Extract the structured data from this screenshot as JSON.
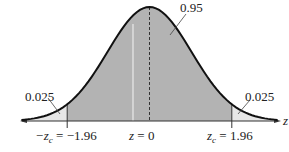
{
  "chart_data": {
    "type": "area",
    "title": "",
    "xlabel": "z",
    "ylabel": "",
    "mean": 0,
    "std": 1,
    "xlim": [
      -3.2,
      3.2
    ],
    "critical_values": [
      -1.96,
      1.96
    ],
    "regions": [
      {
        "name": "left-tail",
        "from": -3.2,
        "to": -1.96,
        "area": 0.025,
        "label": "0.025",
        "fill": "#e6e6e6"
      },
      {
        "name": "center",
        "from": -1.96,
        "to": 1.96,
        "area": 0.95,
        "label": "0.95",
        "fill": "#b3b3b3"
      },
      {
        "name": "right-tail",
        "from": 1.96,
        "to": 3.2,
        "area": 0.025,
        "label": "0.025",
        "fill": "#e6e6e6"
      }
    ],
    "tick_labels": [
      {
        "x": -1.96,
        "text": "−zₓ = −1.96",
        "sym": "-z",
        "sub": "c",
        "val": " = −1.96"
      },
      {
        "x": 0,
        "text": "z = 0"
      },
      {
        "x": 1.96,
        "text": "zₓ = 1.96",
        "sym": "z",
        "sub": "c",
        "val": " = 1.96"
      }
    ],
    "annotations": [
      "0.95",
      "0.025",
      "0.025"
    ],
    "mean_line": "dashed",
    "grid": false,
    "legend": null
  },
  "labels": {
    "center_area": "0.95",
    "left_tail": "0.025",
    "right_tail": "0.025",
    "axis_var": "z",
    "left_crit_sym": "−z",
    "left_crit_sub": "c",
    "left_crit_val": " = −1.96",
    "mean_label": "z = 0",
    "right_crit_sym": "z",
    "right_crit_sub": "c",
    "right_crit_val": " = 1.96"
  },
  "colors": {
    "curve": "#111111",
    "center_fill": "#b3b3b3",
    "tail_fill": "#e6e6e6",
    "axis": "#333333"
  }
}
